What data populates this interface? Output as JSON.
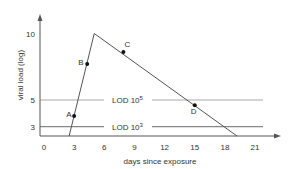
{
  "chart_data": {
    "type": "line",
    "title": "",
    "xlabel": "days since exposure",
    "ylabel": "viral load (log)",
    "x_ticks": [
      0,
      3,
      6,
      9,
      12,
      15,
      18,
      21
    ],
    "y_ticks": [
      3,
      5,
      10
    ],
    "xlim": [
      -0.5,
      22.5
    ],
    "ylim": [
      2.2,
      11.5
    ],
    "grid": false,
    "series": [
      {
        "name": "viral load",
        "x": [
          2.5,
          5,
          19.2
        ],
        "y": [
          2.2,
          10,
          2.2
        ],
        "color": "#555555"
      }
    ],
    "reference_lines": [
      {
        "label": "LOD 10",
        "exponent": "5",
        "y": 5,
        "color": "#aaaaaa"
      },
      {
        "label": "LOD 10",
        "exponent": "3",
        "y": 3,
        "color": "#888888"
      }
    ],
    "points": [
      {
        "label": "A",
        "x": 3.0,
        "y": 3.8
      },
      {
        "label": "B",
        "x": 4.3,
        "y": 7.7
      },
      {
        "label": "C",
        "x": 7.9,
        "y": 8.6
      },
      {
        "label": "D",
        "x": 15.0,
        "y": 4.6
      }
    ]
  }
}
